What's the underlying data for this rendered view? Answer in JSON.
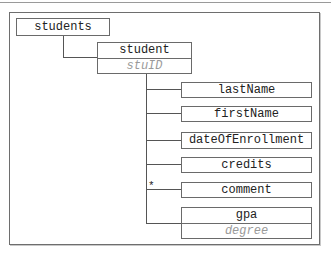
{
  "diagram": {
    "type": "xml-tree",
    "root": {
      "label": "students",
      "children": [
        {
          "label": "student",
          "attribute": "stuID",
          "children": [
            {
              "label": "lastName",
              "multiplicity": ""
            },
            {
              "label": "firstName",
              "multiplicity": ""
            },
            {
              "label": "dateOfEnrollment",
              "multiplicity": ""
            },
            {
              "label": "credits",
              "multiplicity": ""
            },
            {
              "label": "comment",
              "multiplicity": "*"
            },
            {
              "label": "gpa",
              "attribute": "degree",
              "multiplicity": ""
            }
          ]
        }
      ]
    }
  },
  "nodes": {
    "students": "students",
    "student": "student",
    "student_attr": "stuID",
    "lastName": "lastName",
    "firstName": "firstName",
    "dateOfEnrollment": "dateOfEnrollment",
    "credits": "credits",
    "comment": "comment",
    "comment_multiplicity": "*",
    "gpa": "gpa",
    "gpa_attr": "degree"
  },
  "colors": {
    "border": "#6a6a6a",
    "text": "#222222",
    "attribute_text": "#9a9a9a"
  }
}
